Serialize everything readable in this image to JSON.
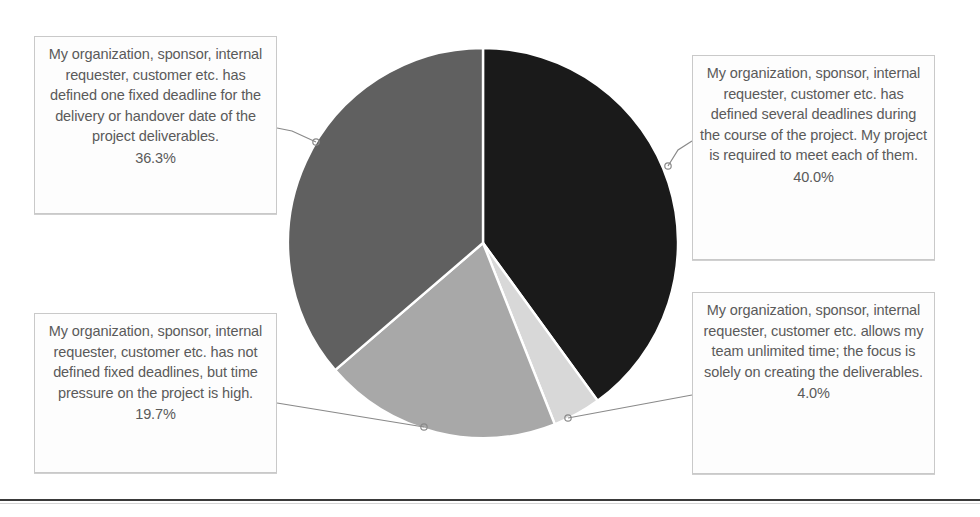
{
  "chart_data": {
    "type": "pie",
    "title": "",
    "labels": [
      "My organization, sponsor, internal requester, customer etc. has defined several deadlines during the course of the project. My project is required to meet each of them.",
      "My organization, sponsor, internal requester, customer etc. allows my team unlimited time; the focus is solely on creating the deliverables.",
      "My organization, sponsor, internal requester, customer etc. has not defined fixed deadlines, but time pressure on the project is high.",
      "My organization, sponsor, internal requester, customer etc. has defined one fixed deadline for the delivery or handover date of the project deliverables."
    ],
    "values": [
      40.0,
      4.0,
      19.7,
      36.3
    ],
    "value_labels": [
      "40.0%",
      "4.0%",
      "19.7%",
      "36.3%"
    ],
    "colors": [
      "#1a1a1a",
      "#d8d8d8",
      "#a8a8a8",
      "#606060"
    ],
    "start_angle": 0,
    "direction": "clockwise",
    "slice_border_color": "#ffffff",
    "legend": "none",
    "data_labels_position": "outside-callout-boxes",
    "center_x": 483,
    "center_y": 243,
    "radius": 195
  },
  "callouts": {
    "fixed_deadline": {
      "text": "My organization, sponsor, internal requester, customer etc. has defined one fixed deadline for the delivery or handover date of the project deliverables.",
      "percent": "36.3%"
    },
    "several_deadlines": {
      "text": "My organization, sponsor, internal requester, customer etc. has defined several deadlines during the course of the project. My project is required to meet each of them.",
      "percent": "40.0%"
    },
    "no_fixed_deadlines": {
      "text": "My organization, sponsor, internal requester, customer etc. has not defined fixed deadlines, but time pressure on the project is high.",
      "percent": "19.7%"
    },
    "unlimited_time": {
      "text": "My organization, sponsor, internal requester, customer etc. allows my team unlimited time; the focus is solely on creating the deliverables.",
      "percent": "4.0%"
    }
  },
  "style": {
    "text_color": "#5a5a5a",
    "box_border_color": "#c9c9c9",
    "leader_line_color": "#8a8a8a",
    "rule_color": "#3a3a3a",
    "background": "#ffffff"
  }
}
